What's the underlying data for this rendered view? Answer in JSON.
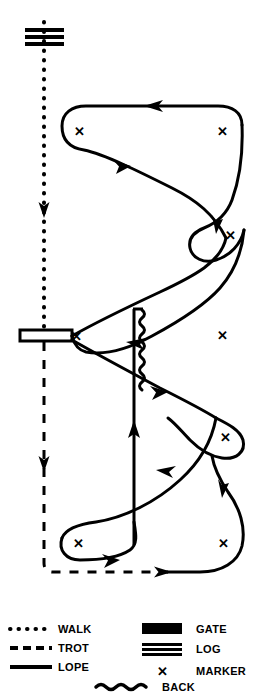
{
  "diagram": {
    "stroke_color": "#000000",
    "background_color": "#ffffff",
    "obstacles": [
      {
        "name": "log",
        "type": "log",
        "x": 44,
        "y": 38,
        "label": "LOG"
      },
      {
        "name": "gate",
        "type": "gate",
        "x": 44,
        "y": 336,
        "label": "GATE"
      },
      {
        "name": "back-through",
        "type": "back",
        "x": 139,
        "y": 312,
        "label": "BACK"
      }
    ],
    "markers": [
      {
        "name": "marker-top-left",
        "x": 79,
        "y": 131
      },
      {
        "name": "marker-top-right",
        "x": 222,
        "y": 131
      },
      {
        "name": "marker-mid-right",
        "x": 230,
        "y": 235
      },
      {
        "name": "marker-gate-right",
        "x": 222,
        "y": 335
      },
      {
        "name": "marker-lower-right",
        "x": 225,
        "y": 437
      },
      {
        "name": "marker-gate-side",
        "x": 74,
        "y": 336
      },
      {
        "name": "marker-bottom-left",
        "x": 78,
        "y": 543
      },
      {
        "name": "marker-bottom-right",
        "x": 223,
        "y": 543
      }
    ],
    "gaits": {
      "walk": {
        "label": "WALK",
        "style": "dotted"
      },
      "trot": {
        "label": "TROT",
        "style": "dashed"
      },
      "lope": {
        "label": "LOPE",
        "style": "solid"
      }
    }
  },
  "legend": {
    "name": "legend",
    "left_column": [
      {
        "key": "walk",
        "label": "WALK",
        "symbol": "dotted-line"
      },
      {
        "key": "trot",
        "label": "TROT",
        "symbol": "dashed-line"
      },
      {
        "key": "lope",
        "label": "LOPE",
        "symbol": "solid-line"
      }
    ],
    "right_column": [
      {
        "key": "gate",
        "label": "GATE",
        "symbol": "filled-bar"
      },
      {
        "key": "log",
        "label": "LOG",
        "symbol": "triple-bar"
      },
      {
        "key": "marker",
        "label": "MARKER",
        "symbol": "x-mark"
      }
    ],
    "bottom_row": [
      {
        "key": "back",
        "label": "BACK",
        "symbol": "wavy-line"
      }
    ]
  },
  "marker_glyph": "✕"
}
